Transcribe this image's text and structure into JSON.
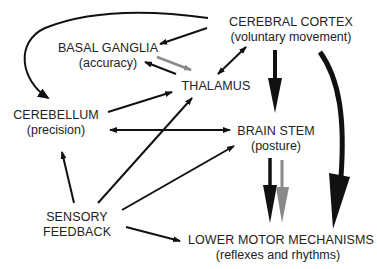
{
  "nodes": {
    "cerebral_cortex": {
      "title": "CEREBRAL CORTEX",
      "subtitle": "(voluntary movement)"
    },
    "basal_ganglia": {
      "title": "BASAL GANGLIA",
      "subtitle": "(accuracy)"
    },
    "thalamus": {
      "title": "THALAMUS"
    },
    "cerebellum": {
      "title": "CEREBELLUM",
      "subtitle": "(precision)"
    },
    "brain_stem": {
      "title": "BRAIN STEM",
      "subtitle": "(posture)"
    },
    "sensory_feedback": {
      "title": "SENSORY",
      "title2": "FEEDBACK"
    },
    "lower_motor": {
      "title": "LOWER MOTOR MECHANISMS",
      "subtitle": "(reflexes and rhythms)"
    }
  },
  "colors": {
    "arrow": "#111111",
    "gray_arrow": "#8a8a8a",
    "text": "#222222"
  }
}
